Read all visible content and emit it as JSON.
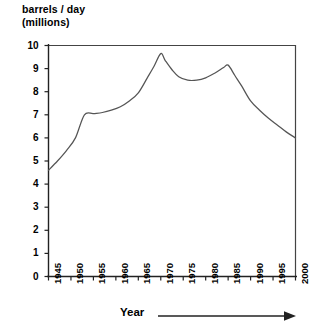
{
  "chart_data": {
    "type": "line",
    "title_lines": [
      "barrels / day",
      "(millions)"
    ],
    "xlabel": "Year",
    "ylabel": "barrels / day (millions)",
    "xlim": [
      1945,
      2000
    ],
    "ylim": [
      0,
      10
    ],
    "grid": false,
    "legend": null,
    "x_tick_labels": [
      "1945",
      "1950",
      "1955",
      "1960",
      "1965",
      "1970",
      "1975",
      "1980",
      "1985",
      "1990",
      "1995",
      "2000"
    ],
    "x_ticks": [
      1945,
      1950,
      1955,
      1960,
      1965,
      1970,
      1975,
      1980,
      1985,
      1990,
      1995,
      2000
    ],
    "y_tick_labels": [
      "0",
      "1",
      "2",
      "3",
      "4",
      "5",
      "6",
      "7",
      "8",
      "9",
      "10"
    ],
    "y_ticks": [
      0,
      1,
      2,
      3,
      4,
      5,
      6,
      7,
      8,
      9,
      10
    ],
    "series": [
      {
        "name": "barrels per day",
        "color": "#555555",
        "x": [
          1945,
          1947,
          1949,
          1951,
          1953,
          1955,
          1957,
          1959,
          1961,
          1963,
          1965,
          1967,
          1968.5,
          1970,
          1971,
          1972.5,
          1974,
          1976,
          1978,
          1980,
          1982,
          1984,
          1985,
          1986.5,
          1988,
          1990,
          1992,
          1994,
          1996,
          1998,
          2000
        ],
        "y": [
          4.6,
          5.0,
          5.45,
          6.0,
          7.0,
          7.05,
          7.1,
          7.2,
          7.35,
          7.6,
          7.95,
          8.6,
          9.1,
          9.65,
          9.35,
          8.95,
          8.65,
          8.5,
          8.5,
          8.6,
          8.8,
          9.05,
          9.15,
          8.7,
          8.25,
          7.6,
          7.2,
          6.85,
          6.55,
          6.25,
          6.0
        ]
      }
    ],
    "annotations": [
      {
        "name": "x-axis-arrow",
        "text": "",
        "shape": "right-arrow"
      }
    ],
    "colors": {
      "line": "#555555",
      "axis": "#333333",
      "text": "#000000",
      "background": "#ffffff"
    }
  },
  "axis_caption": {
    "year_label": "Year"
  }
}
